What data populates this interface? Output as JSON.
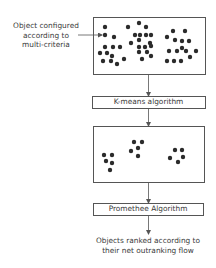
{
  "colors": {
    "stroke": "#555555",
    "dot": "#2b2b2b",
    "text": "#3a3a3a"
  },
  "input_label": {
    "lines": [
      "Object configured",
      "according to",
      "multi-criteria"
    ]
  },
  "top_box": {
    "x": 93,
    "y": 17,
    "w": 112,
    "h": 57,
    "dots": [
      [
        105,
        27
      ],
      [
        105,
        35
      ],
      [
        114,
        37
      ],
      [
        105,
        47
      ],
      [
        113,
        47
      ],
      [
        120,
        47
      ],
      [
        100,
        53
      ],
      [
        107,
        53
      ],
      [
        112,
        56
      ],
      [
        103,
        61
      ],
      [
        111,
        61
      ],
      [
        117,
        64
      ],
      [
        124,
        59
      ],
      [
        128,
        27
      ],
      [
        139,
        23
      ],
      [
        146,
        27
      ],
      [
        135,
        35
      ],
      [
        140,
        35
      ],
      [
        146,
        35
      ],
      [
        151,
        35
      ],
      [
        139,
        40
      ],
      [
        131,
        43
      ],
      [
        150,
        43
      ],
      [
        139,
        47
      ],
      [
        145,
        47
      ],
      [
        151,
        46
      ],
      [
        139,
        52
      ],
      [
        147,
        52
      ],
      [
        142,
        59
      ],
      [
        151,
        56
      ],
      [
        173,
        31
      ],
      [
        185,
        31
      ],
      [
        167,
        37
      ],
      [
        175,
        40
      ],
      [
        182,
        41
      ],
      [
        189,
        41
      ],
      [
        169,
        51
      ],
      [
        177,
        51
      ],
      [
        182,
        48
      ],
      [
        186,
        51
      ],
      [
        196,
        51
      ],
      [
        167,
        61
      ],
      [
        174,
        61
      ],
      [
        181,
        61
      ],
      [
        190,
        57
      ]
    ]
  },
  "kmeans_box": {
    "x": 92,
    "y": 96,
    "w": 113,
    "h": 12,
    "label": "K-means algorithm"
  },
  "middle_box": {
    "x": 93,
    "y": 126,
    "w": 111,
    "h": 56,
    "dots": [
      [
        104,
        155
      ],
      [
        112,
        155
      ],
      [
        106,
        161
      ],
      [
        112,
        163
      ],
      [
        110,
        170
      ],
      [
        134,
        142
      ],
      [
        142,
        142
      ],
      [
        138,
        148
      ],
      [
        131,
        151
      ],
      [
        138,
        156
      ],
      [
        175,
        150
      ],
      [
        182,
        150
      ],
      [
        183,
        157
      ],
      [
        170,
        158
      ],
      [
        178,
        162
      ]
    ]
  },
  "promethee_box": {
    "x": 93,
    "y": 203,
    "w": 110,
    "h": 12,
    "label": "Promethee Algorithm"
  },
  "output_label": {
    "lines": [
      "Objects ranked according to",
      "their net outranking flow"
    ]
  },
  "connector_x": 148
}
